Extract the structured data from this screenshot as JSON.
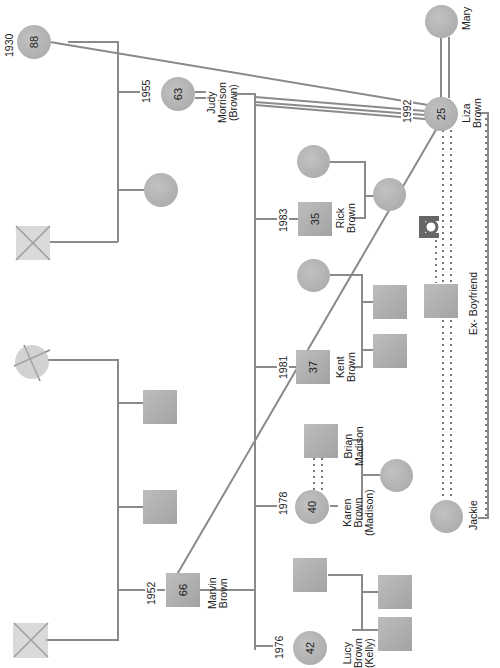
{
  "diagram": {
    "type": "genogram",
    "orientation": "rotated-90-clockwise",
    "colors": {
      "line": "#8a8a8a",
      "symbol_fill": "#b0b0b0",
      "dotted_line": "#777777",
      "text": "#222222"
    },
    "people": {
      "grandmother_88": {
        "shape": "circle",
        "age": "88",
        "year": "1930"
      },
      "judy": {
        "shape": "circle",
        "age": "63",
        "year": "1955",
        "name": "Judy Morrison (Brown)",
        "name_lines": [
          "Judy",
          "Morrison",
          "(Brown)"
        ]
      },
      "marvin": {
        "shape": "square",
        "age": "66",
        "year": "1952",
        "name": "Marvin Brown",
        "name_lines": [
          "Marvin",
          "Brown"
        ]
      },
      "liza": {
        "shape": "circle",
        "age": "25",
        "year": "1992",
        "name": "Liza Brown",
        "name_lines": [
          "Liza",
          "Brown"
        ]
      },
      "mary": {
        "shape": "circle",
        "name": "Mary"
      },
      "rick": {
        "shape": "square",
        "age": "35",
        "year": "1983",
        "name": "Rick Brown",
        "name_lines": [
          "Rick",
          "Brown"
        ]
      },
      "kent": {
        "shape": "square",
        "age": "37",
        "year": "1981",
        "name": "Kent Brown",
        "name_lines": [
          "Kent",
          "Brown"
        ]
      },
      "karen": {
        "shape": "circle",
        "age": "40",
        "year": "1978",
        "name": "Karen Brown (Madison)",
        "name_lines": [
          "Karen",
          "Brown",
          "(Madison)"
        ]
      },
      "lucy": {
        "shape": "circle",
        "age": "42",
        "year": "1976",
        "name": "Lucy Brown (Kelly)",
        "name_lines": [
          "Lucy",
          "Brown",
          "(Kelly)"
        ]
      },
      "brian": {
        "shape": "square",
        "name": "Brian Madison",
        "name_lines": [
          "Brian",
          "Madison"
        ]
      },
      "ex_boyfriend": {
        "shape": "square",
        "name": "Ex- Boyfriend"
      },
      "jackie": {
        "shape": "circle",
        "name": "Jackie"
      },
      "judy_father": {
        "shape": "square",
        "deceased": true
      },
      "judy_sibling": {
        "shape": "circle"
      },
      "marvin_mother": {
        "shape": "circle",
        "deceased": true
      },
      "marvin_father": {
        "shape": "square",
        "deceased": true
      },
      "marvin_brother_1": {
        "shape": "square"
      },
      "marvin_brother_2": {
        "shape": "square"
      },
      "rick_spouse": {
        "shape": "circle"
      },
      "rick_child": {
        "shape": "circle"
      },
      "kent_spouse": {
        "shape": "circle"
      },
      "kent_child_1": {
        "shape": "square"
      },
      "kent_child_2": {
        "shape": "square"
      },
      "karen_child": {
        "shape": "circle"
      },
      "lucy_spouse": {
        "shape": "square"
      },
      "lucy_child_1": {
        "shape": "square"
      },
      "lucy_child_2": {
        "shape": "square"
      }
    }
  }
}
